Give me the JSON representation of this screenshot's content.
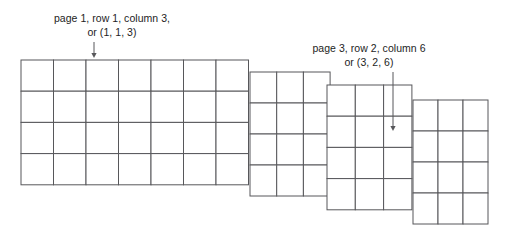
{
  "figure": {
    "title": "",
    "annotations": [
      {
        "id": "annotation-one",
        "line1": "page 1, row 1, column 3,",
        "line2": "or (1, 1, 3)",
        "pointer_icon": "down-arrow-icon",
        "target_page": 1,
        "target_row": 1,
        "target_column": 3
      },
      {
        "id": "annotation-two",
        "line1": "page 3, row 2, column 6",
        "line2": "or (3, 2, 6)",
        "pointer_icon": "down-arrow-icon",
        "target_page": 3,
        "target_row": 2,
        "target_column": 6
      }
    ],
    "colors": {
      "stroke": "#57575a",
      "fill": "#ffffff",
      "text": "#1d1d1d"
    },
    "pages": [
      {
        "name": "page-1-grid",
        "label": "page 1",
        "columns": 7,
        "rows": 4,
        "x": 21,
        "y": 60,
        "cell_width": 32.5,
        "cell_height": 31.2
      },
      {
        "name": "page-2-grid",
        "label": "page 2",
        "columns": 3,
        "rows": 4,
        "x": 250,
        "y": 72,
        "cell_width": 26.7,
        "cell_height": 31.0
      },
      {
        "name": "page-3-grid",
        "label": "page 3",
        "columns": 3,
        "rows": 4,
        "x": 327,
        "y": 85,
        "cell_width": 28.3,
        "cell_height": 31.2
      },
      {
        "name": "page-4-grid",
        "label": "page 4",
        "columns": 3,
        "rows": 4,
        "x": 413,
        "y": 100,
        "cell_width": 25.0,
        "cell_height": 31.0
      }
    ],
    "pointers": [
      {
        "name": "pointer-page-1",
        "x": 94,
        "y_start": 42,
        "y_end": 58
      },
      {
        "name": "pointer-page-3",
        "x": 393,
        "y_start": 72,
        "y_end": 131
      }
    ]
  }
}
